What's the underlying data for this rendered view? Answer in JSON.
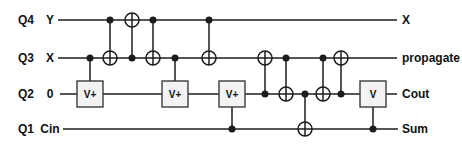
{
  "colors": {
    "background": "#ffffff",
    "line": "#1c1c1c",
    "box_fill": "#f3f3f3",
    "box_border": "#3c3c3c",
    "text": "#111111"
  },
  "style": {
    "wire_stroke": 1.6,
    "vertical_stroke": 1.5,
    "dot_radius": 3.5,
    "oplus_radius": 7,
    "oplus_stroke": 1.5,
    "box_size": 26,
    "label_font_size": 12,
    "box_font_size": 10
  },
  "circuit": {
    "wires": [
      {
        "id": "Q4",
        "qubit_label": "Q4",
        "input_label": "Y",
        "output_label": "X",
        "y": 20,
        "x1": 58,
        "x2": 397
      },
      {
        "id": "Q3",
        "qubit_label": "Q3",
        "input_label": "X",
        "output_label": "propagate",
        "y": 58,
        "x1": 58,
        "x2": 397
      },
      {
        "id": "Q2",
        "qubit_label": "Q2",
        "input_label": "0",
        "output_label": "Cout",
        "y": 94,
        "x1": 60,
        "x2": 397
      },
      {
        "id": "Q1",
        "qubit_label": "Q1",
        "input_label": "Cin",
        "output_label": "Sum",
        "y": 129,
        "x1": 63,
        "x2": 398
      }
    ],
    "label_columns": {
      "qubit_x": 26,
      "input_x": 50,
      "output_x": 402
    },
    "gates": [
      {
        "type": "controlled-box",
        "x": 90,
        "control": "Q3",
        "box": "Q2",
        "label": "V+"
      },
      {
        "type": "cnot",
        "x": 110,
        "control": "Q4",
        "target": "Q3"
      },
      {
        "type": "cnot",
        "x": 132,
        "control": "Q3",
        "target": "Q4"
      },
      {
        "type": "cnot",
        "x": 153,
        "control": "Q4",
        "target": "Q3"
      },
      {
        "type": "controlled-box",
        "x": 175,
        "control": "Q3",
        "box": "Q2",
        "label": "V+"
      },
      {
        "type": "cnot",
        "x": 209,
        "control": "Q4",
        "target": "Q3"
      },
      {
        "type": "controlled-box",
        "x": 232,
        "control": "Q1",
        "box": "Q2",
        "label": "V+"
      },
      {
        "type": "cnot",
        "x": 265,
        "control": "Q2",
        "target": "Q3"
      },
      {
        "type": "cnot",
        "x": 286,
        "control": "Q3",
        "target": "Q2"
      },
      {
        "type": "cnot",
        "x": 305,
        "control": "Q2",
        "target": "Q1"
      },
      {
        "type": "cnot",
        "x": 323,
        "control": "Q3",
        "target": "Q2"
      },
      {
        "type": "cnot",
        "x": 341,
        "control": "Q2",
        "target": "Q3"
      },
      {
        "type": "controlled-box",
        "x": 373,
        "control": "Q1",
        "box": "Q2",
        "label": "V"
      }
    ]
  }
}
